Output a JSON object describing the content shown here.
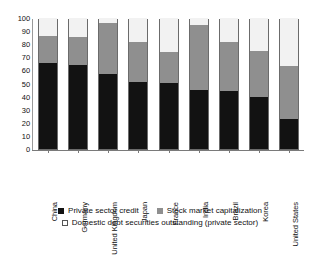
{
  "chart_data": {
    "type": "bar",
    "stacked": true,
    "title": "",
    "subtitle": "",
    "xlabel": "",
    "ylabel": "",
    "ylim": [
      0,
      100
    ],
    "yticks": [
      0,
      10,
      20,
      30,
      40,
      50,
      60,
      70,
      80,
      90,
      100
    ],
    "ytick_labels": [
      "0",
      "10",
      "20",
      "30",
      "40",
      "50",
      "60",
      "70",
      "80",
      "90",
      "100"
    ],
    "grid": false,
    "legend_position": "bottom",
    "categories": [
      "China",
      "Germany",
      "United Kingdom",
      "Japan",
      "France",
      "India",
      "Brazil",
      "Korea",
      "United States"
    ],
    "series": [
      {
        "name": "Private sector credit",
        "color": "#121212",
        "values": [
          66,
          64,
          57,
          51,
          50.5,
          45,
          44.5,
          40,
          23
        ]
      },
      {
        "name": "Stock market capitalization",
        "color": "#8f8f8f",
        "values": [
          20,
          21.5,
          39,
          31,
          23.5,
          50,
          37.5,
          35,
          40
        ]
      },
      {
        "name": "Domestic debt securities outstanding (private sector)",
        "color": "#ffffff",
        "values": [
          14,
          14.5,
          4,
          18,
          26,
          5,
          18,
          25,
          37
        ]
      }
    ],
    "cumulative_tops": [
      [
        66,
        86,
        100
      ],
      [
        64,
        85.5,
        100
      ],
      [
        57,
        96,
        100
      ],
      [
        51,
        82,
        100
      ],
      [
        50.5,
        74,
        100
      ],
      [
        45,
        95,
        100
      ],
      [
        44.5,
        82,
        100
      ],
      [
        40,
        75,
        100
      ],
      [
        23,
        63,
        100
      ]
    ]
  },
  "legend": {
    "items": [
      {
        "label": "Private sector credit",
        "swatch": "black-square-icon"
      },
      {
        "label": "Stock market capitalization",
        "swatch": "gray-square-icon"
      },
      {
        "label": "Domestic debt securities outstanding (private sector)",
        "swatch": "white-square-icon"
      }
    ]
  }
}
